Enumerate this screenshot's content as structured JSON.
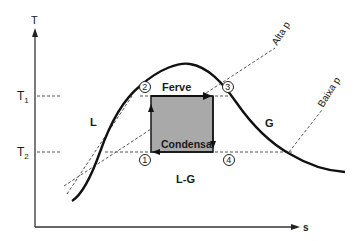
{
  "diagram": {
    "type": "temperature-entropy diagram (refrigeration cycle)",
    "axes": {
      "y_label": "T",
      "x_label": "s",
      "y_ticks": [
        {
          "label": "T",
          "sub": "1",
          "y": 96
        },
        {
          "label": "T",
          "sub": "2",
          "y": 152
        }
      ]
    },
    "regions": {
      "liquid": "L",
      "gas": "G",
      "mixture": "L-G"
    },
    "process_labels": {
      "top": "Ferve",
      "bottom": "Condensa"
    },
    "points": [
      {
        "id": "1",
        "label": "1",
        "x": 145,
        "y": 160
      },
      {
        "id": "2",
        "label": "2",
        "x": 145,
        "y": 87
      },
      {
        "id": "3",
        "label": "3",
        "x": 213,
        "y": 87
      },
      {
        "id": "4",
        "label": "4",
        "x": 213,
        "y": 160
      }
    ],
    "isobars": [
      {
        "label": "Alta p"
      },
      {
        "label": "Baixa p"
      }
    ],
    "colors": {
      "curve": "#111111",
      "rect_fill": "#a9a9a9",
      "dashed": "#555555",
      "text": "#1a1a1a"
    }
  }
}
